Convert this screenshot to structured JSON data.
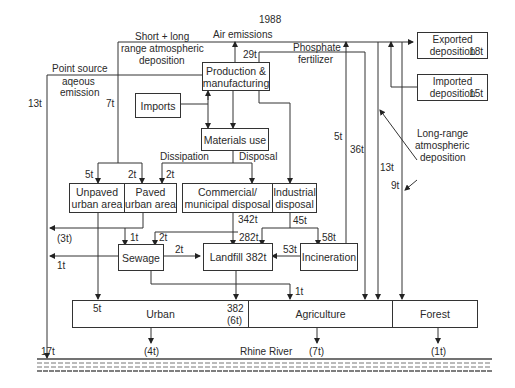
{
  "title": "1988",
  "nodes": {
    "production": "Production & manufacturing",
    "imports": "Imports",
    "materials_use": "Materials use",
    "unpaved": "Unpaved urban area",
    "paved": "Paved urban area",
    "commercial": "Commercial/ municipal disposal",
    "industrial": "Industrial disposal",
    "sewage": "Sewage",
    "landfill": "Landfill 382t",
    "incineration": "Incineration",
    "exported": "Exported deposition",
    "exported_value": "18t",
    "imported": "Imported deposition",
    "imported_value": "15t",
    "urban": "Urban",
    "agriculture": "Agriculture",
    "forest": "Forest"
  },
  "labels": {
    "air_emissions": "Air emissions",
    "short_long": "Short + long",
    "range_atmos": "range atmospheric",
    "deposition": "deposition",
    "point_source": "Point source",
    "aqeous": "aqeous",
    "emission": "emission",
    "phosphate": "Phosphate",
    "fertilizer": "fertilizer",
    "dissipation": "Dissipation",
    "disposal": "Disposal",
    "long_range": "Long-range",
    "atmospheric": "atmospheric",
    "deposition2": "deposition",
    "rhine": "Rhine River"
  },
  "flows": {
    "air_29t": "29t",
    "point_13t": "13t",
    "short_7t": "7t",
    "unpaved_5t": "5t",
    "paved_2t": "2t",
    "dissip_2t": "2t",
    "phos_5t": "5t",
    "phos_36t": "36t",
    "lr_13t": "13t",
    "lr_9t": "9t",
    "comm_342t": "342t",
    "ind_45t": "45t",
    "landfill_282t": "282t",
    "incin_58t": "58t",
    "incin_53t": "53t",
    "runoff_3t": "(3t)",
    "sewage_1t_in": "1t",
    "sewage_2t_in": "2t",
    "sewage_landfill_2t": "2t",
    "sewage_out_1t": "1t",
    "agri_1t": "1t",
    "urban_5t": "5t",
    "urban_382": "382",
    "urban_6t": "(6t)",
    "river_17t": "17t",
    "river_4t": "(4t)",
    "river_7t": "(7t)",
    "river_1t": "(1t)"
  }
}
